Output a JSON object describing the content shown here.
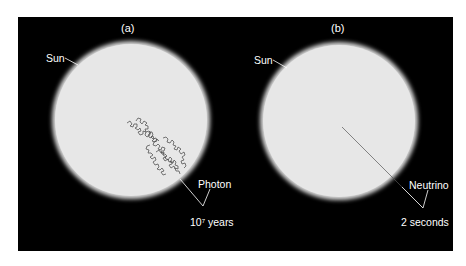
{
  "figure": {
    "background": "#000000",
    "disk_color": "#e7e7e7",
    "panels": [
      {
        "id": "a",
        "letter": "(a)",
        "sun_label": "Sun",
        "particle_label": "Photon",
        "time_base": "10",
        "time_exponent": "7",
        "time_unit": " years",
        "path_type": "random-walk"
      },
      {
        "id": "b",
        "letter": "(b)",
        "sun_label": "Sun",
        "particle_label": "Neutrino",
        "time_label": "2 seconds",
        "path_type": "straight-line"
      }
    ]
  }
}
